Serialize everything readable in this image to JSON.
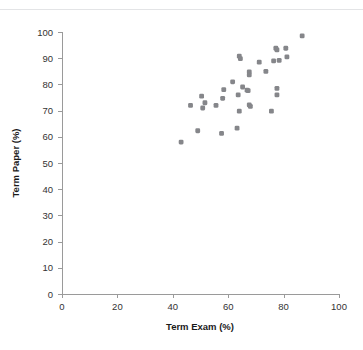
{
  "chart_data": {
    "type": "scatter",
    "title": "",
    "xlabel": "Term Exam (%)",
    "ylabel": "Term Paper (%)",
    "xlim": [
      0,
      100
    ],
    "ylim": [
      0,
      100
    ],
    "xticks": [
      0,
      20,
      40,
      60,
      80,
      100
    ],
    "yticks": [
      0,
      10,
      20,
      30,
      40,
      50,
      60,
      70,
      80,
      90,
      100
    ],
    "xtick_labels": [
      "0",
      "20",
      "40",
      "60",
      "80",
      "100"
    ],
    "ytick_labels": [
      "0",
      "10",
      "20",
      "30",
      "40",
      "50",
      "60",
      "70",
      "80",
      "90",
      "100"
    ],
    "grid": false,
    "legend": null,
    "marker_color": "#85868a",
    "marker_size": 3,
    "points": [
      {
        "x": 43.0,
        "y": 58.0
      },
      {
        "x": 46.4,
        "y": 72.0
      },
      {
        "x": 49.0,
        "y": 62.3
      },
      {
        "x": 50.4,
        "y": 75.5
      },
      {
        "x": 50.8,
        "y": 71.0
      },
      {
        "x": 51.6,
        "y": 73.0
      },
      {
        "x": 55.6,
        "y": 72.0
      },
      {
        "x": 57.6,
        "y": 61.3
      },
      {
        "x": 58.0,
        "y": 74.7
      },
      {
        "x": 58.4,
        "y": 78.0
      },
      {
        "x": 61.6,
        "y": 81.0
      },
      {
        "x": 63.2,
        "y": 63.3
      },
      {
        "x": 63.6,
        "y": 76.0
      },
      {
        "x": 64.0,
        "y": 69.8
      },
      {
        "x": 64.0,
        "y": 90.8
      },
      {
        "x": 64.4,
        "y": 89.8
      },
      {
        "x": 65.2,
        "y": 79.0
      },
      {
        "x": 66.8,
        "y": 77.8
      },
      {
        "x": 67.2,
        "y": 77.6
      },
      {
        "x": 67.6,
        "y": 84.8
      },
      {
        "x": 67.6,
        "y": 83.6
      },
      {
        "x": 67.6,
        "y": 72.2
      },
      {
        "x": 68.0,
        "y": 71.6
      },
      {
        "x": 71.2,
        "y": 88.5
      },
      {
        "x": 73.6,
        "y": 85.0
      },
      {
        "x": 75.6,
        "y": 69.8
      },
      {
        "x": 76.4,
        "y": 89.0
      },
      {
        "x": 77.2,
        "y": 93.8
      },
      {
        "x": 77.6,
        "y": 93.2
      },
      {
        "x": 77.6,
        "y": 78.5
      },
      {
        "x": 77.6,
        "y": 76.0
      },
      {
        "x": 78.4,
        "y": 89.2
      },
      {
        "x": 80.8,
        "y": 93.8
      },
      {
        "x": 81.2,
        "y": 90.5
      },
      {
        "x": 86.7,
        "y": 98.5
      }
    ]
  },
  "axes": {
    "x_label": "Term Exam (%)",
    "y_label": "Term Paper (%)"
  }
}
